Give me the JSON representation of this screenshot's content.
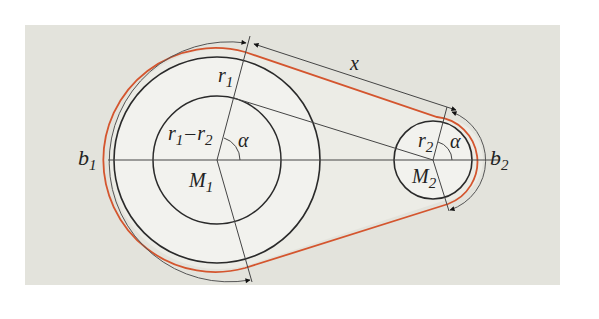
{
  "colors": {
    "page_bg": "#ffffff",
    "panel_bg": "#e3e3dc",
    "pulley_fill": "#f2f2ee",
    "line": "#2a2a2a",
    "thin_line": "#555555",
    "belt": "#d4552e"
  },
  "labels": {
    "r1": "r",
    "r1_sub": "1",
    "r2": "r",
    "r2_sub": "2",
    "diff_a": "r",
    "diff_a_sub": "1",
    "diff_minus": "–",
    "diff_b": "r",
    "diff_b_sub": "2",
    "alpha_left": "α",
    "alpha_right": "α",
    "M1": "M",
    "M1_sub": "1",
    "M2": "M",
    "M2_sub": "2",
    "b1": "b",
    "b1_sub": "1",
    "b2": "b",
    "b2_sub": "2",
    "x": "x"
  }
}
